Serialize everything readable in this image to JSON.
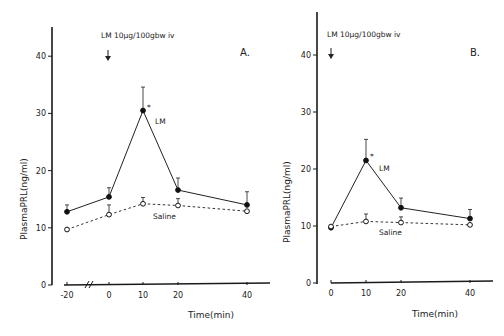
{
  "chart_data": [
    {
      "panel": "A.",
      "type": "line",
      "annotation": "LM 10µg/100gbw iv",
      "xlabel": "Time(min)",
      "ylabel": "PlasmaPRL(ng/ml)",
      "x": [
        -20,
        0,
        10,
        20,
        40
      ],
      "x_ticks": [
        "-20",
        "0",
        "10",
        "20",
        "40"
      ],
      "y_ticks": [
        "0",
        "10",
        "20",
        "30",
        "40"
      ],
      "ylim": [
        0,
        45
      ],
      "axis_break": true,
      "series": [
        {
          "name": "LM",
          "marker": "filled-circle",
          "line": "solid",
          "values": [
            12.8,
            15.4,
            30.5,
            16.6,
            14.0
          ],
          "error_upper": [
            14.0,
            17.0,
            34.6,
            18.7,
            16.3
          ],
          "significant": [
            false,
            false,
            true,
            false,
            false
          ]
        },
        {
          "name": "Saline",
          "marker": "open-circle",
          "line": "dashed",
          "values": [
            9.7,
            12.3,
            14.2,
            13.9,
            12.9
          ],
          "error_upper": [
            9.7,
            14.0,
            15.3,
            15.1,
            12.9
          ]
        }
      ]
    },
    {
      "panel": "B.",
      "type": "line",
      "annotation": "LM 10µg/100gbw iv",
      "xlabel": "Time(min)",
      "ylabel": "PlasmaPRL(ng/ml)",
      "x": [
        0,
        10,
        20,
        40
      ],
      "x_ticks": [
        "0",
        "10",
        "20",
        "40"
      ],
      "y_ticks": [
        "0",
        "10",
        "20",
        "30",
        "40"
      ],
      "ylim": [
        0,
        45
      ],
      "series": [
        {
          "name": "LM",
          "marker": "filled-circle",
          "line": "solid",
          "values": [
            9.7,
            21.5,
            13.2,
            11.3
          ],
          "error_upper": [
            9.7,
            25.2,
            14.9,
            12.9
          ],
          "significant": [
            false,
            true,
            false,
            false
          ]
        },
        {
          "name": "Saline",
          "marker": "open-circle",
          "line": "dashed",
          "values": [
            9.9,
            10.8,
            10.6,
            10.2
          ],
          "error_upper": [
            9.9,
            12.1,
            11.6,
            10.2
          ]
        }
      ]
    }
  ],
  "labels": {
    "a": {
      "panel": "A.",
      "annotation": "LM 10µg/100gbw iv",
      "lm": "LM",
      "saline": "Saline",
      "xlabel": "Time(min)",
      "ylabel": "PlasmaPRL(ng/ml)",
      "star": "*"
    },
    "b": {
      "panel": "B.",
      "annotation": "LM 10µg/100gbw iv",
      "lm": "LM",
      "saline": "Saline",
      "xlabel": "Time(min)",
      "ylabel": "PlasmaPRL(ng/ml)",
      "star": "*"
    }
  }
}
